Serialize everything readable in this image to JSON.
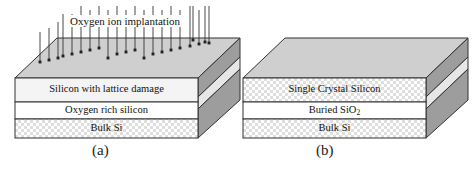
{
  "figure": {
    "title_present": false,
    "panels": [
      {
        "id": "a",
        "caption": "(a)",
        "annotation": "Oxygen ion implantation",
        "arrow_count": 22,
        "layers": [
          {
            "name": "Silicon with lattice damage",
            "fill": "plain-light"
          },
          {
            "name": "Oxygen rich silicon",
            "fill": "plain-white"
          },
          {
            "name": "Bulk Si",
            "fill": "cross-hatch"
          }
        ]
      },
      {
        "id": "b",
        "caption": "(b)",
        "annotation": "",
        "arrow_count": 0,
        "layers": [
          {
            "name": "Single Crystal Silicon",
            "fill": "cross-hatch"
          },
          {
            "name": "Buried SiO",
            "subscript": "2",
            "fill": "plain-white"
          },
          {
            "name": "Bulk Si",
            "fill": "cross-hatch"
          }
        ]
      }
    ]
  },
  "colors": {
    "top_face": "#cfcfcf",
    "side_face_dark": "#9a9a9a",
    "side_face_light": "#e3e3e3",
    "front_face_light": "#f3f3f3",
    "front_face_white": "#ffffff",
    "hatch": "#d8d8d8",
    "outline": "#333333",
    "text": "#111111",
    "background": "#ffffff"
  }
}
